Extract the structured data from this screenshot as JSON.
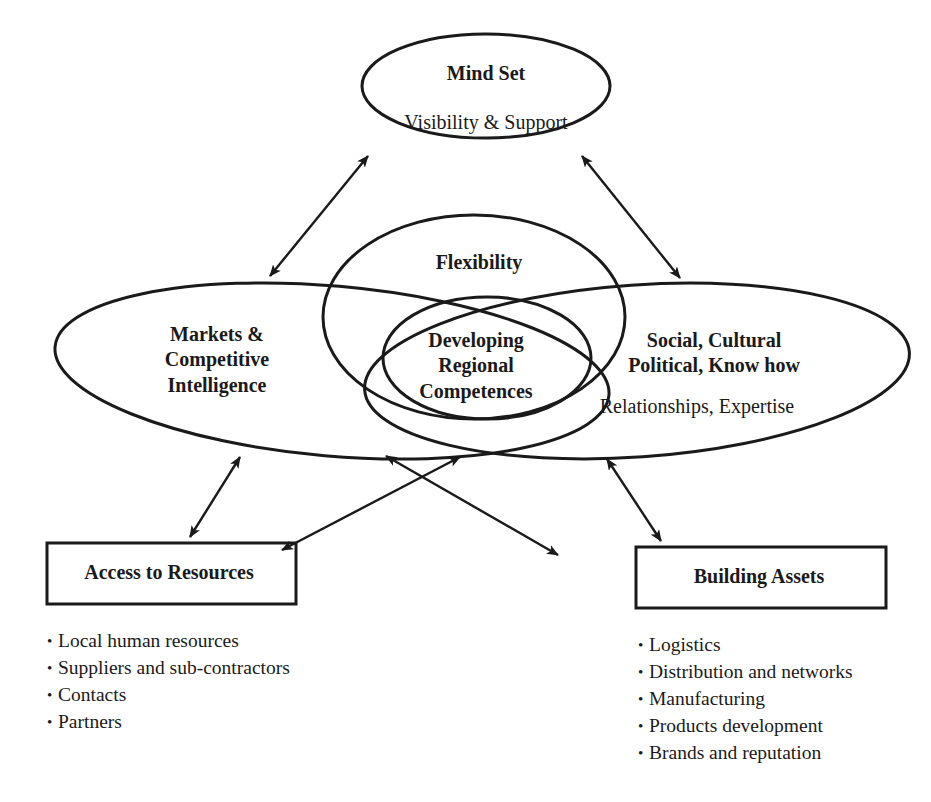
{
  "diagram": {
    "nodes": {
      "mind_set": {
        "title": "Mind Set",
        "subtitle": "Visibility & Support"
      },
      "flexibility": {
        "title": "Flexibility"
      },
      "markets": {
        "line1": "Markets &",
        "line2": "Competitive",
        "line3": "Intelligence"
      },
      "developing": {
        "line1": "Developing",
        "line2": "Regional",
        "line3": "Competences"
      },
      "social": {
        "line1": "Social, Cultural",
        "line2": "Political, Know how",
        "subtitle": "Relationships, Expertise"
      },
      "access": {
        "title": "Access to Resources",
        "items": [
          "Local human resources",
          "Suppliers and sub-contractors",
          "Contacts",
          "Partners"
        ]
      },
      "building": {
        "title": "Building Assets",
        "items": [
          "Logistics",
          "Distribution and networks",
          "Manufacturing",
          "Products development",
          "Brands and reputation"
        ]
      }
    },
    "edges": [
      {
        "from": "mind_set",
        "to": "markets",
        "type": "bidirectional"
      },
      {
        "from": "mind_set",
        "to": "social",
        "type": "bidirectional"
      },
      {
        "from": "markets",
        "to": "access",
        "type": "bidirectional"
      },
      {
        "from": "social",
        "to": "access",
        "type": "bidirectional"
      },
      {
        "from": "markets",
        "to": "building",
        "type": "bidirectional"
      },
      {
        "from": "social",
        "to": "building",
        "type": "bidirectional"
      }
    ],
    "colors": {
      "stroke": "#1a1a1a",
      "background": "#ffffff"
    }
  }
}
